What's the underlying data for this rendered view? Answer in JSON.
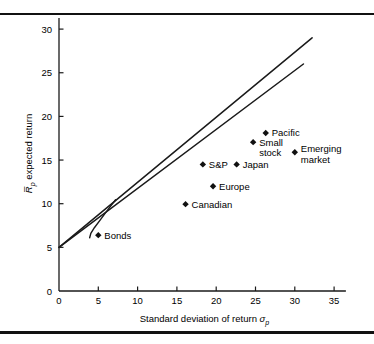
{
  "figure": {
    "top_rule": "horizontal-rule",
    "bottom_rule": "horizontal-rule"
  },
  "chart_data": {
    "type": "scatter",
    "title": "",
    "xlabel": "Standard deviation of return σp",
    "xlabel_main": "Standard deviation of return",
    "xlabel_symbol": "σ",
    "xlabel_subscript": "p",
    "ylabel": "R̅p expected return",
    "ylabel_symbol": "R̅",
    "ylabel_subscript": "p",
    "ylabel_main": "expected return",
    "xlim": [
      0,
      36.5
    ],
    "ylim": [
      0,
      31.5
    ],
    "xticks": [
      0,
      5,
      10,
      15,
      20,
      25,
      30,
      35
    ],
    "yticks": [
      0,
      5,
      10,
      15,
      20,
      25,
      30
    ],
    "xtick_labels": [
      "0",
      "5",
      "10",
      "15",
      "20",
      "25",
      "30",
      "35"
    ],
    "ytick_labels": [
      "0",
      "5",
      "10",
      "15",
      "20",
      "25",
      "30"
    ],
    "grid": false,
    "legend": "none",
    "marker": "diamond",
    "points": [
      {
        "label": "Bonds",
        "x": 5.0,
        "y": 6.4,
        "label_dx": 6,
        "label_dy": 3.5,
        "anchor": "start"
      },
      {
        "label": "Canadian",
        "x": 16.1,
        "y": 9.95,
        "label_dx": 6,
        "label_dy": 3.5,
        "anchor": "start"
      },
      {
        "label": "Europe",
        "x": 19.6,
        "y": 12.0,
        "label_dx": 6,
        "label_dy": 3.5,
        "anchor": "start"
      },
      {
        "label": "S&P",
        "x": 18.3,
        "y": 14.5,
        "label_dx": 6,
        "label_dy": 3.5,
        "anchor": "start"
      },
      {
        "label": "Japan",
        "x": 22.6,
        "y": 14.5,
        "label_dx": 6,
        "label_dy": 3.5,
        "anchor": "start"
      },
      {
        "label": "Pacific",
        "x": 26.3,
        "y": 18.1,
        "label_dx": 6,
        "label_dy": 3.5,
        "anchor": "start"
      },
      {
        "label": "Small stock",
        "x": 24.7,
        "y": 17.05,
        "label_dx": 6,
        "label_dy": 3.5,
        "anchor": "start",
        "lines": [
          "Small",
          "stock"
        ]
      },
      {
        "label": "Emerging market",
        "x": 30.0,
        "y": 15.9,
        "label_dx": 6,
        "label_dy": 0.0,
        "anchor": "start",
        "lines": [
          "Emerging",
          "market"
        ]
      }
    ],
    "lines": [
      {
        "name": "capital-market-line-upper",
        "points": [
          [
            0,
            5.0
          ],
          [
            32.2,
            29.0
          ]
        ]
      },
      {
        "name": "capital-market-line-lower",
        "points": [
          [
            0,
            5.0
          ],
          [
            31.1,
            26.0
          ]
        ]
      }
    ],
    "curves": [
      {
        "name": "efficient-frontier",
        "points": [
          [
            7.2,
            10.45
          ],
          [
            6.2,
            9.3
          ],
          [
            5.3,
            8.2
          ],
          [
            4.5,
            7.25
          ],
          [
            4.05,
            6.6
          ],
          [
            3.9,
            6.1
          ]
        ]
      }
    ]
  }
}
